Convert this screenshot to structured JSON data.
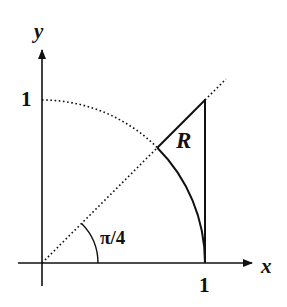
{
  "diagram": {
    "type": "geometry-figure",
    "colors": {
      "ink": "#111111",
      "background": "#ffffff"
    },
    "axes": {
      "x_label": "x",
      "y_label": "y",
      "x_tick_label": "1",
      "y_tick_label": "1"
    },
    "elements": {
      "quarter_circle": {
        "style": "dotted",
        "radius": 1,
        "note": "dotted from angle pi/4 to pi/2, solid from 0 to pi/4"
      },
      "diagonal_line": {
        "equation": "y = x",
        "style": "dotted"
      },
      "vertical_line": {
        "equation": "x = 1",
        "style": "solid"
      },
      "region_label": "R",
      "angle_label": "π/4"
    }
  }
}
